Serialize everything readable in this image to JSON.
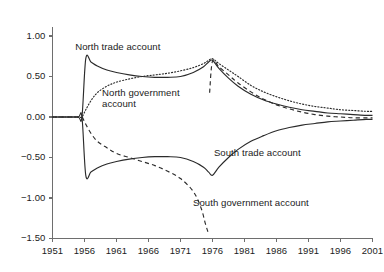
{
  "chart_data": {
    "type": "line",
    "title": "",
    "subtitle": "",
    "xlabel": "",
    "ylabel": "",
    "xlim": [
      1951,
      2001
    ],
    "ylim": [
      -1.5,
      1.0
    ],
    "grid": false,
    "legend_position": "inline-annotations",
    "x_ticks": [
      "1951",
      "1956",
      "1961",
      "1966",
      "1971",
      "1976",
      "1981",
      "1986",
      "1991",
      "1996",
      "2001"
    ],
    "y_ticks": [
      "1.00",
      "0.50",
      "0.00",
      "−0.50",
      "−1.00",
      "−1.50"
    ],
    "annotations": [
      {
        "name": "north-trade-account",
        "text": "North trade account",
        "x": 1961.2,
        "y": 0.86
      },
      {
        "name": "north-government-account",
        "text": "North government\naccount",
        "x": 1964.8,
        "y": 0.3
      },
      {
        "name": "south-trade-account",
        "text": "South trade account",
        "x": 1983.0,
        "y": -0.45
      },
      {
        "name": "south-government-account",
        "text": "South government account",
        "x": 1982.0,
        "y": -1.06
      }
    ],
    "series": [
      {
        "name": "North trade account",
        "style": "solid",
        "x": [
          1951,
          1953,
          1955,
          1955.6,
          1956.2,
          1957,
          1958,
          1959.5,
          1961,
          1963,
          1965,
          1967,
          1969,
          1971,
          1973,
          1974.6,
          1975.4,
          1976,
          1977,
          1978.5,
          1980,
          1982,
          1984,
          1986,
          1988,
          1990,
          1992,
          1994,
          1996,
          1998,
          2000,
          2001
        ],
        "y": [
          0.0,
          0.0,
          0.0,
          0.0,
          0.72,
          0.68,
          0.63,
          0.58,
          0.55,
          0.52,
          0.5,
          0.49,
          0.49,
          0.5,
          0.55,
          0.62,
          0.68,
          0.7,
          0.6,
          0.48,
          0.38,
          0.28,
          0.21,
          0.16,
          0.12,
          0.09,
          0.07,
          0.05,
          0.04,
          0.03,
          0.02,
          0.02
        ]
      },
      {
        "name": "North government account",
        "style": "dotted",
        "x": [
          1951,
          1953,
          1955,
          1955.6,
          1956.2,
          1957,
          1958,
          1959.5,
          1961,
          1963,
          1965,
          1967,
          1969,
          1971,
          1973,
          1974.6,
          1975.4,
          1976,
          1977,
          1978.5,
          1980,
          1982,
          1984,
          1986,
          1988,
          1990,
          1992,
          1994,
          1996,
          1998,
          2000,
          2001
        ],
        "y": [
          0.0,
          0.0,
          0.0,
          0.0,
          0.09,
          0.2,
          0.3,
          0.38,
          0.43,
          0.47,
          0.5,
          0.52,
          0.54,
          0.57,
          0.61,
          0.66,
          0.7,
          0.72,
          0.66,
          0.58,
          0.5,
          0.39,
          0.31,
          0.25,
          0.2,
          0.16,
          0.13,
          0.11,
          0.09,
          0.08,
          0.07,
          0.07
        ]
      },
      {
        "name": "South trade account",
        "style": "solid",
        "x": [
          1951,
          1953,
          1955,
          1955.6,
          1956.2,
          1957,
          1958,
          1959.5,
          1961,
          1963,
          1965,
          1967,
          1969,
          1971,
          1973,
          1974.6,
          1975.4,
          1976,
          1977,
          1978.5,
          1980,
          1982,
          1984,
          1986,
          1988,
          1990,
          1992,
          1994,
          1996,
          1998,
          2000,
          2001
        ],
        "y": [
          0.0,
          0.0,
          0.0,
          0.0,
          -0.72,
          -0.68,
          -0.63,
          -0.58,
          -0.55,
          -0.52,
          -0.5,
          -0.49,
          -0.49,
          -0.5,
          -0.55,
          -0.62,
          -0.68,
          -0.72,
          -0.62,
          -0.5,
          -0.4,
          -0.3,
          -0.23,
          -0.17,
          -0.13,
          -0.1,
          -0.08,
          -0.06,
          -0.05,
          -0.04,
          -0.03,
          -0.03
        ]
      },
      {
        "name": "South government account",
        "style": "dashed",
        "x": [
          1951,
          1953,
          1955,
          1955.6,
          1956.2,
          1957,
          1958,
          1959.5,
          1961,
          1963,
          1965,
          1967,
          1969,
          1971,
          1973,
          1974.2,
          1974.9,
          1975.3,
          1975.45,
          1975.55,
          1976,
          1977,
          1978.5,
          1980,
          1982,
          1984,
          1986,
          1988,
          1990,
          1992,
          1994,
          1996,
          1998,
          2000,
          2001
        ],
        "y": [
          0.0,
          0.0,
          0.0,
          0.0,
          -0.09,
          -0.2,
          -0.3,
          -0.38,
          -0.45,
          -0.5,
          -0.55,
          -0.6,
          -0.67,
          -0.76,
          -0.92,
          -1.12,
          -1.32,
          -1.42,
          -1.44,
          0.3,
          0.69,
          0.62,
          0.52,
          0.42,
          0.31,
          0.22,
          0.15,
          0.1,
          0.06,
          0.03,
          0.01,
          0.0,
          -0.01,
          -0.01,
          -0.01
        ]
      }
    ]
  },
  "axes": {
    "y_tick_labels": [
      {
        "value": 1.0,
        "text": "1.00"
      },
      {
        "value": 0.5,
        "text": "0.50"
      },
      {
        "value": 0.0,
        "text": "0.00"
      },
      {
        "value": -0.5,
        "text": "−0.50"
      },
      {
        "value": -1.0,
        "text": "−1.00"
      },
      {
        "value": -1.5,
        "text": "−1.50"
      }
    ],
    "x_tick_labels": [
      {
        "value": 1951,
        "text": "1951"
      },
      {
        "value": 1956,
        "text": "1956"
      },
      {
        "value": 1961,
        "text": "1961"
      },
      {
        "value": 1966,
        "text": "1966"
      },
      {
        "value": 1971,
        "text": "1971"
      },
      {
        "value": 1976,
        "text": "1976"
      },
      {
        "value": 1981,
        "text": "1981"
      },
      {
        "value": 1986,
        "text": "1986"
      },
      {
        "value": 1991,
        "text": "1991"
      },
      {
        "value": 1996,
        "text": "1996"
      },
      {
        "value": 2001,
        "text": "2001"
      }
    ]
  },
  "labels": {
    "north_trade": "North trade account",
    "north_government_line1": "North government",
    "north_government_line2": "account",
    "south_trade": "South trade account",
    "south_government": "South government account"
  },
  "colors": {
    "line": "#2b2b2b",
    "axis": "#6e6e6e",
    "text": "#1b1b1b",
    "background": "#ffffff"
  }
}
